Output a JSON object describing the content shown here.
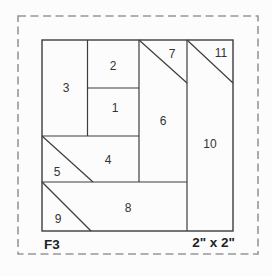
{
  "pattern": {
    "id": "F3",
    "finished_size": "2\" x 2\"",
    "pieces": [
      {
        "number": "1"
      },
      {
        "number": "2"
      },
      {
        "number": "3"
      },
      {
        "number": "4"
      },
      {
        "number": "5"
      },
      {
        "number": "6"
      },
      {
        "number": "7"
      },
      {
        "number": "8"
      },
      {
        "number": "9"
      },
      {
        "number": "10"
      },
      {
        "number": "11"
      }
    ]
  },
  "colors": {
    "background": "#fcfcfc",
    "seam_line": "#3d3d3d",
    "cutting_border_dashed": "#979797",
    "text": "#333333"
  }
}
